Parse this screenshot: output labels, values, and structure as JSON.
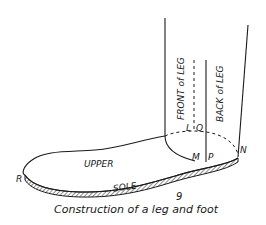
{
  "figure": {
    "number": "9",
    "caption": "Construction of a leg and foot"
  },
  "labels": {
    "front_of_leg": "FRONT of LEG",
    "back_of_leg": "BACK of LEG",
    "upper": "UPPER",
    "sole": "SOLE",
    "point_L": "L",
    "point_Q": "Q",
    "point_M": "M",
    "point_P": "P",
    "point_N": "N",
    "point_R": "R"
  },
  "colors": {
    "ink": "#1a1a1a",
    "background": "#ffffff"
  }
}
